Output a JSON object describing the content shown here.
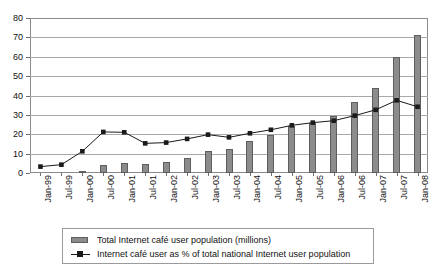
{
  "chart_data": {
    "type": "bar",
    "title": "",
    "subtitle": "",
    "xlabel": "",
    "ylabel": "",
    "ylim": [
      0,
      80
    ],
    "ytick_step": 10,
    "yticks": [
      0,
      10,
      20,
      30,
      40,
      50,
      60,
      70,
      80
    ],
    "grid": true,
    "legend_position": "bottom",
    "categories": [
      "Jan-99",
      "Jul-99",
      "Jan-00",
      "Jul-00",
      "Jan-01",
      "Jul-01",
      "Jan-02",
      "Jul-02",
      "Jan-03",
      "Jul-03",
      "Jan-04",
      "Jul-04",
      "Jan-05",
      "Jul-05",
      "Jan-06",
      "Jul-06",
      "Jan-07",
      "Jul-07",
      "Jan-08"
    ],
    "series": [
      {
        "name": "Total Internet café user population (millions)",
        "type": "bar",
        "color": "#8c8c8c",
        "values": [
          0,
          0,
          0.5,
          4,
          5,
          4.5,
          5.5,
          8,
          11.5,
          12.3,
          16.5,
          19.5,
          24.5,
          26,
          29.5,
          36.5,
          44,
          60,
          71
        ]
      },
      {
        "name": "Internet café user as % of total national Internet user population",
        "type": "line",
        "color": "#1a1a1a",
        "marker": "square",
        "values": [
          3.3,
          4.3,
          11.2,
          21.2,
          21,
          15.3,
          15.7,
          17.6,
          19.8,
          18.4,
          20.5,
          22.3,
          24.6,
          26,
          27,
          29.6,
          32.6,
          37.5,
          34.2
        ]
      }
    ]
  },
  "legend": {
    "items": [
      {
        "label": "Total Internet café user population (millions)",
        "swatch": "bar-swatch"
      },
      {
        "label": "Internet café user as % of total national Internet user population",
        "swatch": "line-marker-swatch"
      }
    ]
  },
  "axis": {
    "y_tick_labels": [
      "0",
      "10",
      "20",
      "30",
      "40",
      "50",
      "60",
      "70",
      "80"
    ]
  },
  "colors": {
    "bar_fill": "#8c8c8c",
    "bar_edge": "#5e5e5e",
    "line": "#1a1a1a",
    "gridline": "#a9a9a9",
    "frame": "#8a8a8a",
    "background": "#ffffff"
  }
}
